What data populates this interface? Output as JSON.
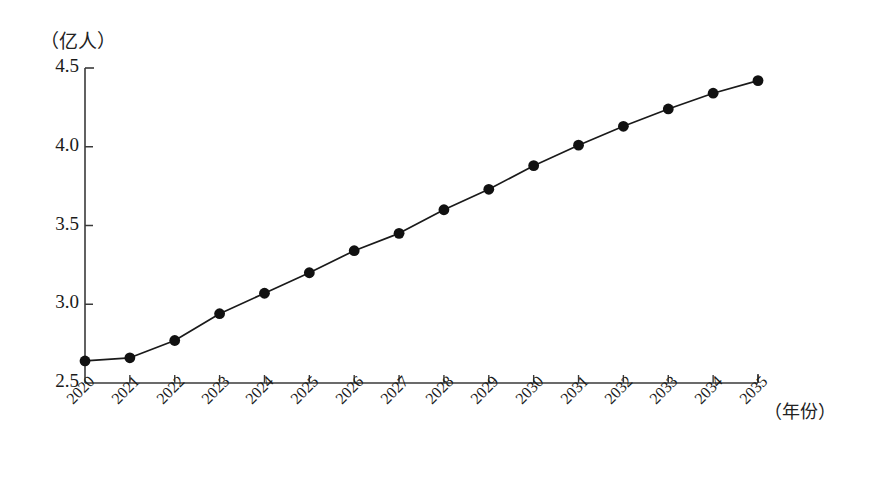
{
  "chart_data": {
    "type": "line",
    "title": "",
    "subtitle": "",
    "xlabel": "（年份）",
    "ylabel": "（亿人）",
    "categories": [
      "2020",
      "2021",
      "2022",
      "2023",
      "2024",
      "2025",
      "2026",
      "2027",
      "2028",
      "2029",
      "2030",
      "2031",
      "2032",
      "2033",
      "2034",
      "2035"
    ],
    "values": [
      2.64,
      2.66,
      2.77,
      2.94,
      3.07,
      3.2,
      3.34,
      3.45,
      3.6,
      3.73,
      3.88,
      4.01,
      4.13,
      4.24,
      4.34,
      4.42
    ],
    "series": [
      {
        "name": "人口",
        "values": [
          2.64,
          2.66,
          2.77,
          2.94,
          3.07,
          3.2,
          3.34,
          3.45,
          3.6,
          3.73,
          3.88,
          4.01,
          4.13,
          4.24,
          4.34,
          4.42
        ]
      }
    ],
    "ylim": [
      2.5,
      4.5
    ],
    "y_ticks": [
      2.5,
      3.0,
      3.5,
      4.0,
      4.5
    ],
    "y_tick_labels": [
      "2.5",
      "3.0",
      "3.5",
      "4.0",
      "4.5"
    ],
    "grid": false,
    "legend": false,
    "legend_position": "none",
    "marker": "filled-circle",
    "line_color": "#1a1a1a",
    "marker_color": "#111111",
    "axis_color": "#3a3a3a",
    "background_color": "#ffffff"
  },
  "axes": {
    "y_unit_caption": "（亿人）",
    "x_unit_caption": "（年份）"
  }
}
